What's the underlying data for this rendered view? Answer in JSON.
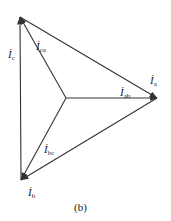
{
  "caption": "(b)",
  "vectors": [
    {
      "id": "Ic",
      "symbol": "İ",
      "subscript": "c",
      "from": "b",
      "to": "c"
    },
    {
      "id": "Ica",
      "symbol": "İ",
      "subscript": "ca",
      "from": "o",
      "to": "c"
    },
    {
      "id": "Ia",
      "symbol": "İ",
      "subscript": "a",
      "from": "c",
      "to": "a"
    },
    {
      "id": "Iab",
      "symbol": "İ",
      "subscript": "ab",
      "from": "o",
      "to": "a"
    },
    {
      "id": "Ib",
      "symbol": "İ",
      "subscript": "b",
      "from": "a",
      "to": "b"
    },
    {
      "id": "Ibc",
      "symbol": "İ",
      "subscript": "bc",
      "from": "o",
      "to": "b"
    }
  ],
  "colors": {
    "line": "#333333",
    "text": "#222222"
  }
}
